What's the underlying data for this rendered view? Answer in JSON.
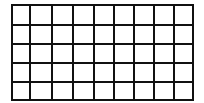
{
  "grid": {
    "columns": 9,
    "rows": 5,
    "x_lines": [
      12,
      30,
      52,
      73,
      94,
      114,
      134,
      154,
      174,
      193
    ],
    "y_lines": [
      5,
      25,
      44,
      63,
      82,
      100
    ],
    "line_color": "#111111",
    "line_width": 2,
    "cell_fill": "#ffffff"
  }
}
